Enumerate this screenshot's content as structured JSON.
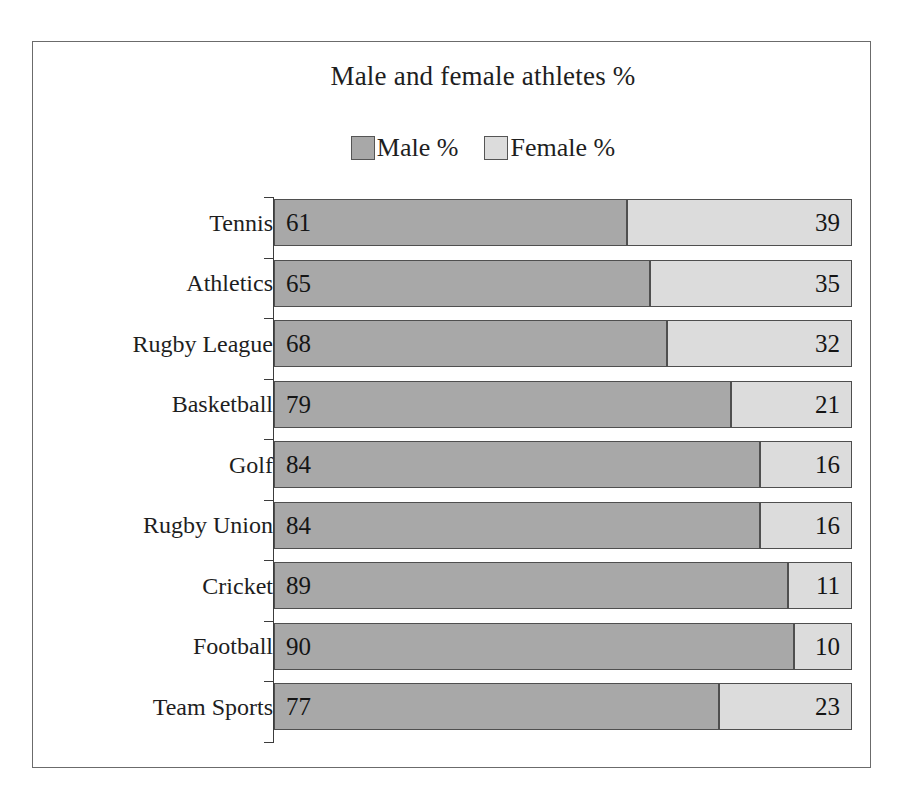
{
  "chart_data": {
    "type": "bar",
    "subtype": "horizontal-stacked-100pct",
    "title": "Male and female athletes %",
    "xlabel": "",
    "ylabel": "",
    "xlim": [
      0,
      100
    ],
    "grid": false,
    "legend_position": "top-center",
    "categories": [
      "Tennis",
      "Athletics",
      "Rugby League",
      "Basketball",
      "Golf",
      "Rugby Union",
      "Cricket",
      "Football",
      "Team Sports"
    ],
    "series": [
      {
        "name": "Male %",
        "color": "#a8a8a8",
        "values": [
          61,
          65,
          68,
          79,
          84,
          84,
          89,
          90,
          77
        ]
      },
      {
        "name": "Female %",
        "color": "#dcdcdc",
        "values": [
          39,
          35,
          32,
          21,
          16,
          16,
          11,
          10,
          23
        ]
      }
    ]
  },
  "legend": {
    "entries": [
      {
        "label": "Male %",
        "swatch_name": "legend-swatch-male"
      },
      {
        "label": "Female %",
        "swatch_name": "legend-swatch-female"
      }
    ]
  },
  "colors": {
    "male": "#a8a8a8",
    "female": "#dcdcdc",
    "bar_border": "#4f4f4f",
    "axis": "#3c3c3c",
    "frame": "#6b6b6b",
    "background": "#ffffff",
    "text": "#1e1e1e"
  }
}
